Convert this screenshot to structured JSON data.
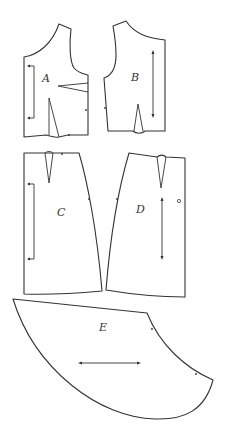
{
  "diagram": {
    "type": "sewing pattern pieces",
    "line_color": "#333333",
    "background": "#ffffff",
    "pieces": [
      {
        "id": "A",
        "label": "A",
        "description": "front bodice with side dart and waist dart, fold-line bracket on left edge"
      },
      {
        "id": "B",
        "label": "B",
        "description": "back bodice with waist dart and vertical grainline arrow"
      },
      {
        "id": "C",
        "label": "C",
        "description": "front skirt with waist dart, fold-line bracket on left edge"
      },
      {
        "id": "D",
        "label": "D",
        "description": "back skirt with waist dart, grainline arrow and small circle marker"
      },
      {
        "id": "E",
        "label": "E",
        "description": "curved peplum/flounce piece with horizontal grainline arrow"
      }
    ]
  }
}
